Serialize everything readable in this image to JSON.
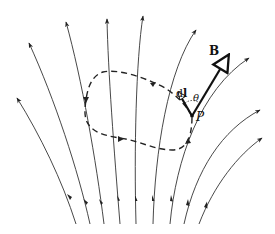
{
  "diagram": {
    "labels": {
      "field_vector": "B",
      "line_element": "dl",
      "line_element_d": "d",
      "line_element_l": "l",
      "angle": "θ",
      "point": "P"
    },
    "colors": {
      "line": "#222222",
      "background": "#ffffff"
    },
    "field_line_count": 10,
    "loop_style": "dashed"
  }
}
